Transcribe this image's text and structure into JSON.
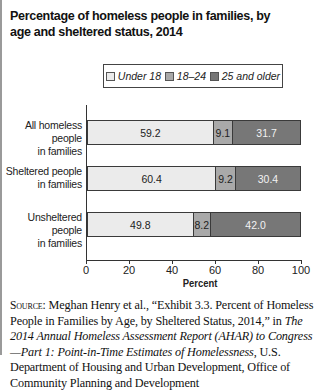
{
  "chart_data": {
    "type": "bar",
    "orientation": "horizontal",
    "stacked": true,
    "title": "Percentage of homeless people in families, by age and sheltered status, 2014",
    "xlabel": "Percent",
    "ylabel": "",
    "xlim": [
      0,
      100
    ],
    "x_ticks": [
      "0",
      "20",
      "40",
      "60",
      "80",
      "100"
    ],
    "grid": false,
    "legend_position": "top",
    "categories": [
      "All homeless people in families",
      "Sheltered people in families",
      "Unsheltered people in families"
    ],
    "series": [
      {
        "name": "Under 18",
        "color": "#ebebeb",
        "values": [
          59.2,
          60.4,
          49.8
        ]
      },
      {
        "name": "18–24",
        "color": "#a9a9a9",
        "values": [
          9.1,
          9.2,
          8.2
        ]
      },
      {
        "name": "25 and older",
        "color": "#777777",
        "values": [
          31.7,
          30.4,
          42.0
        ]
      }
    ],
    "data_labels": [
      [
        "59.2",
        "9.1",
        "31.7"
      ],
      [
        "60.4",
        "9.2",
        "30.4"
      ],
      [
        "49.8",
        "8.2",
        "42.0"
      ]
    ]
  },
  "title": "Percentage of homeless people in families, by age and sheltered status, 2014",
  "legend": [
    "Under 18",
    "18–24",
    "25 and older"
  ],
  "category_lines": [
    [
      "All homeless people",
      "in families"
    ],
    [
      "Sheltered people",
      "in families"
    ],
    [
      "Unsheltered people",
      "in families"
    ]
  ],
  "xlabel": "Percent",
  "source": {
    "label": "Source:",
    "text1": " Meghan Henry et al., “Exhibit 3.3. Percent of Homeless People in Families by Age, by Sheltered Status, 2014,” in ",
    "italic": "The 2014 Annual Homeless Assessment Report (AHAR) to Congress—Part 1: Point-in-Time Estimates of Homelessness",
    "text2": ", U.S. Department of Housing and Urban Development, Office of Community Planning and Development"
  }
}
